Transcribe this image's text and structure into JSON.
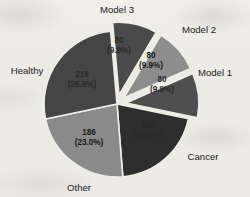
{
  "figure": {
    "background_color": "#eceae5",
    "kind": "pie-chart"
  },
  "chart_data": {
    "type": "pie",
    "title": "",
    "xlabel": "",
    "ylabel": "",
    "total": 810,
    "grid": false,
    "legend_position": "none",
    "labels_outside": true,
    "categories": [
      "Model 3",
      "Model 2",
      "Model 1",
      "Cancer",
      "Other",
      "Healthy"
    ],
    "values": [
      80,
      80,
      80,
      166,
      186,
      218
    ],
    "percent_strings": [
      "(9.9%)",
      "(9.9%)",
      "(9.9%)",
      "(20.5%)",
      "(23.0%)",
      "(26.9%)"
    ],
    "percents": [
      9.9,
      9.9,
      9.9,
      20.5,
      23.0,
      26.9
    ],
    "value_strings": [
      "80",
      "80",
      "80",
      "166",
      "186",
      "218"
    ],
    "colors": [
      "#4a4a4a",
      "#8d8d8d",
      "#4f4f4f",
      "#2e2e2e",
      "#8a8a8a",
      "#454545"
    ],
    "exploded": [
      true,
      true,
      true,
      false,
      false,
      false
    ],
    "slices": [
      {
        "name": "Model 3",
        "label": "Model 3",
        "value": "80",
        "percent": "(9.9%)",
        "color": "#4a4a4a",
        "exploded": true
      },
      {
        "name": "Model 2",
        "label": "Model 2",
        "value": "80",
        "percent": "(9.9%)",
        "color": "#8d8d8d",
        "exploded": true
      },
      {
        "name": "Model 1",
        "label": "Model 1",
        "value": "80",
        "percent": "(9.9%)",
        "color": "#4f4f4f",
        "exploded": true
      },
      {
        "name": "Cancer",
        "label": "Cancer",
        "value": "166",
        "percent": "(20.5%)",
        "color": "#2e2e2e",
        "exploded": false
      },
      {
        "name": "Other",
        "label": "Other",
        "value": "186",
        "percent": "(23.0%)",
        "color": "#8a8a8a",
        "exploded": false
      },
      {
        "name": "Healthy",
        "label": "Healthy",
        "value": "218",
        "percent": "(26.9%)",
        "color": "#454545",
        "exploded": false
      }
    ]
  }
}
